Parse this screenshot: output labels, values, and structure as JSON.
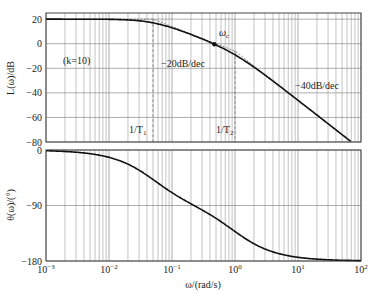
{
  "chart_data": [
    {
      "type": "line",
      "name": "magnitude",
      "ylabel": "L(ω)/dB",
      "xscale": "log",
      "xlim": [
        0.001,
        100
      ],
      "ylim": [
        -80,
        25
      ],
      "yticks": [
        20,
        0,
        -20,
        -40,
        -60,
        -80
      ],
      "ytick_labels": [
        "20",
        "0",
        "−20",
        "−40",
        "−60",
        "−80"
      ],
      "grid": true,
      "gain_k": 10,
      "break_frequencies": {
        "w1": 0.05,
        "w2": 1.0
      },
      "crossover_frequency": 0.47,
      "annotations": {
        "k_label": "(k=10)",
        "slope1": "−20dB/dec",
        "slope2": "−40dB/dec",
        "wc": "ωc",
        "wc_main": "ω",
        "wc_sub": "c",
        "t1_main": "1/T",
        "t1_sub": "1",
        "t2_main": "1/T",
        "t2_sub": "2"
      }
    },
    {
      "type": "line",
      "name": "phase",
      "ylabel": "θ(ω)/(°)",
      "xlabel": "ω/(rad/s)",
      "xscale": "log",
      "xlim": [
        0.001,
        100
      ],
      "ylim": [
        -180,
        0
      ],
      "yticks": [
        0,
        -90,
        -180
      ],
      "ytick_labels": [
        "0",
        "−90",
        "−180"
      ],
      "grid": true
    }
  ],
  "xticks": [
    0.001,
    0.01,
    0.1,
    1,
    10,
    100
  ],
  "xtick_labels": [
    {
      "base": "10",
      "exp": "−3"
    },
    {
      "base": "10",
      "exp": "−2"
    },
    {
      "base": "10",
      "exp": "−1"
    },
    {
      "base": "10",
      "exp": "0"
    },
    {
      "base": "10",
      "exp": "1"
    },
    {
      "base": "10",
      "exp": "2"
    }
  ]
}
